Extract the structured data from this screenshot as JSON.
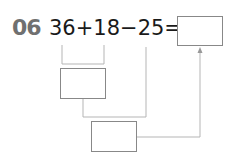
{
  "problem": {
    "number": "06",
    "expression": "36+18−25=",
    "operands": [
      "36",
      "18",
      "25"
    ],
    "operators": [
      "+",
      "−",
      "="
    ]
  },
  "boxes": {
    "answer": "",
    "step1": "",
    "step2": ""
  },
  "colors": {
    "number": "#707070",
    "text": "#1a1a1a",
    "lines": "#b5b5b5",
    "box_border": "#888888"
  }
}
